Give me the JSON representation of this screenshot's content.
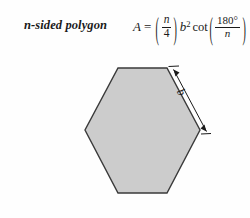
{
  "figure": {
    "caption": "n-sided polygon",
    "shape_name": "regular-hexagon",
    "background_color": "#fefefe",
    "fill_color": "#cccccc",
    "stroke_color": "#3a3a3a"
  },
  "formula": {
    "area_symbol": "A",
    "equals": "=",
    "left_paren": "(",
    "right_paren": ")",
    "coefficient_numerator": "n",
    "coefficient_denominator": "4",
    "base_variable": "b",
    "exponent": "2",
    "function": "cot",
    "angle_numerator": "180°",
    "angle_denominator": "n",
    "plain_text": "A = (n/4)b² cot(180°/n)"
  },
  "dimension": {
    "side_label": "b"
  }
}
